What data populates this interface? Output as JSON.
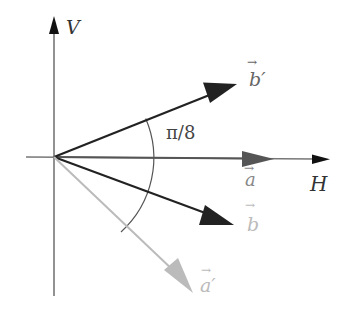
{
  "diagram": {
    "axes": {
      "vertical_label": "V",
      "horizontal_label": "H"
    },
    "angle_label": "π/8",
    "vectors": [
      {
        "id": "a",
        "label": "a",
        "prime": "",
        "color": "#555555",
        "label_color": "#888888"
      },
      {
        "id": "b_prime",
        "label": "b",
        "prime": "′",
        "color": "#222222",
        "label_color": "#666666"
      },
      {
        "id": "b",
        "label": "b",
        "prime": "",
        "color": "#222222",
        "label_color": "#bbbbbb"
      },
      {
        "id": "a_prime",
        "label": "a",
        "prime": "′",
        "color": "#bbbbbb",
        "label_color": "#bbbbbb"
      }
    ],
    "colors": {
      "axis": "#777777",
      "dark_vector": "#222222",
      "mid_vector": "#555555",
      "light_vector": "#bbbbbb",
      "arc": "#555555"
    }
  }
}
